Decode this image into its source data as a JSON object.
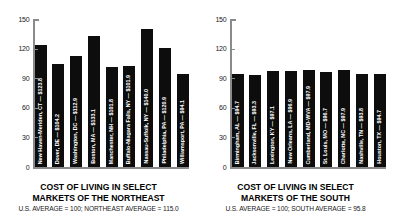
{
  "chart_data": [
    {
      "type": "bar",
      "title": "COST OF LIVING IN SELECT MARKETS OF THE NORTHEAST",
      "title_line1": "COST OF LIVING IN SELECT",
      "title_line2": "MARKETS OF THE NORTHEAST",
      "subtitle": "U.S. AVERAGE = 100;  NORTHEAST AVERAGE = 115.0",
      "xlabel": "",
      "ylabel": "",
      "ylim": [
        0,
        150
      ],
      "yticks": [
        150,
        120,
        90,
        60,
        30,
        0
      ],
      "grid": false,
      "legend": "none",
      "bar_color": "#0d0d0d",
      "categories": [
        "New Haven-Meriden, CT",
        "Dover, DE",
        "Washington, DC",
        "Boston, MA",
        "Manchester, NH",
        "Buffalo-Niagara Falls, NY",
        "Nassau-Suffolk, NY",
        "Philadelphia, PA",
        "Williamsport, PA"
      ],
      "values": [
        123.8,
        104.2,
        112.9,
        133.1,
        101.8,
        101.9,
        140.0,
        120.9,
        94.1
      ],
      "bar_labels": [
        "New Haven-Meriden, CT — $123.8",
        "Dover, DE — $104.2",
        "Washington, DC — $112.9",
        "Boston, MA — $133.1",
        "Manchester, NH — $101.8",
        "Buffalo-Niagara Falls, NY — $101.9",
        "Nassau-Suffolk, NY — $140.0",
        "Philadelphia, PA — $120.9",
        "Williamsport, PA — $94.1"
      ]
    },
    {
      "type": "bar",
      "title": "COST OF LIVING IN SELECT MARKETS OF THE SOUTH",
      "title_line1": "COST OF LIVING IN SELECT",
      "title_line2": "MARKETS OF THE SOUTH",
      "subtitle": "U.S. AVERAGE = 100;  SOUTH AVERAGE = 95.8",
      "xlabel": "",
      "ylabel": "",
      "ylim": [
        0,
        150
      ],
      "yticks": [
        150,
        120,
        90,
        60,
        30,
        0
      ],
      "grid": false,
      "legend": "none",
      "bar_color": "#0d0d0d",
      "categories": [
        "Birmingham, AL",
        "Jacksonville, FL",
        "Lexington, KY",
        "New Orleans, LA",
        "Cumberland, MD-WVA",
        "St. Louis, MO",
        "Charlotte, NC",
        "Nashville, TN",
        "Houston, TX"
      ],
      "values": [
        94.7,
        93.3,
        97.1,
        96.9,
        97.9,
        96.7,
        97.9,
        93.8,
        94.7
      ],
      "bar_labels": [
        "Birmingham, AL — $94.7",
        "Jacksonville, FL — $93.3",
        "Lexington, KY — $97.1",
        "New Orleans, LA — $96.9",
        "Cumberland, MD-WVA — $97.9",
        "St. Louis, MO — $96.7",
        "Charlotte, NC — $97.9",
        "Nashville, TN — $93.8",
        "Houston, TX — $94.7"
      ]
    }
  ]
}
